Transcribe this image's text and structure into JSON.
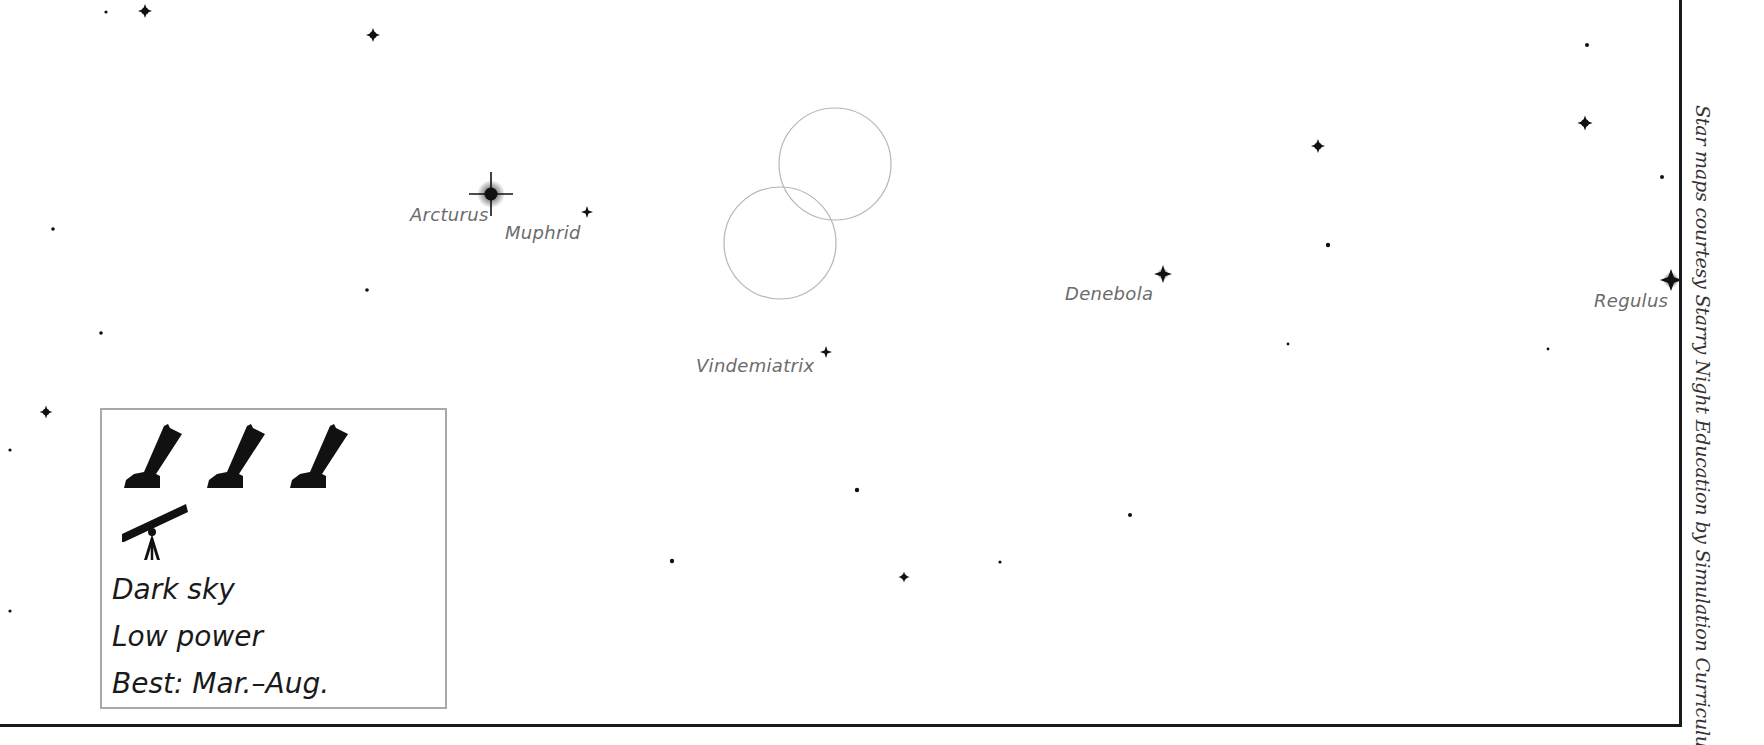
{
  "map": {
    "labels": {
      "arcturus": "Arcturus",
      "muphrid": "Muphrid",
      "vindemiatrix": "Vindemiatrix",
      "denebola": "Denebola",
      "regulus": "Regulus"
    },
    "named_stars": [
      {
        "name": "Arcturus",
        "x": 491,
        "y": 194,
        "size": "brightest"
      },
      {
        "name": "Muphrid",
        "x": 587,
        "y": 212,
        "size": "small"
      },
      {
        "name": "Vindemiatrix",
        "x": 826,
        "y": 352,
        "size": "small"
      },
      {
        "name": "Denebola",
        "x": 1163,
        "y": 274,
        "size": "medium"
      },
      {
        "name": "Regulus",
        "x": 1671,
        "y": 280,
        "size": "bright"
      }
    ],
    "stars": [
      {
        "x": 106,
        "y": 12,
        "r": 1.6
      },
      {
        "x": 145,
        "y": 11,
        "r": 3.5
      },
      {
        "x": 373,
        "y": 35,
        "r": 3.5
      },
      {
        "x": 53,
        "y": 229,
        "r": 1.8
      },
      {
        "x": 367,
        "y": 290,
        "r": 1.8
      },
      {
        "x": 101,
        "y": 333,
        "r": 1.8
      },
      {
        "x": 46,
        "y": 412,
        "r": 3.2
      },
      {
        "x": 10,
        "y": 450,
        "r": 1.6
      },
      {
        "x": 10,
        "y": 611,
        "r": 1.6
      },
      {
        "x": 857,
        "y": 490,
        "r": 2.2
      },
      {
        "x": 672,
        "y": 561,
        "r": 2.2
      },
      {
        "x": 904,
        "y": 577,
        "r": 2.8
      },
      {
        "x": 1000,
        "y": 562,
        "r": 1.6
      },
      {
        "x": 1130,
        "y": 515,
        "r": 2.0
      },
      {
        "x": 1318,
        "y": 146,
        "r": 3.5
      },
      {
        "x": 1328,
        "y": 245,
        "r": 2.2
      },
      {
        "x": 1288,
        "y": 344,
        "r": 1.4
      },
      {
        "x": 1548,
        "y": 349,
        "r": 1.4
      },
      {
        "x": 1587,
        "y": 45,
        "r": 2.0
      },
      {
        "x": 1585,
        "y": 123,
        "r": 3.8
      },
      {
        "x": 1662,
        "y": 177,
        "r": 2.0
      }
    ],
    "target_circles": [
      {
        "cx": 835,
        "cy": 164,
        "r": 56
      },
      {
        "cx": 780,
        "cy": 243,
        "r": 56
      }
    ]
  },
  "legend": {
    "dark_sky": "Dark sky",
    "low_power": "Low power",
    "best": "Best: Mar.–Aug.",
    "icons": [
      "dobsonian-telescope-icon",
      "dobsonian-telescope-icon",
      "dobsonian-telescope-icon",
      "refractor-telescope-icon"
    ]
  },
  "credit": "Star maps courtesy Starry Night Education by Simulation Curriculum",
  "colors": {
    "star": "#111111",
    "label": "#6b6b6b",
    "circle": "#b5b5b5",
    "frame": "#1a1a1a",
    "legend_border": "#a8a8a8"
  }
}
